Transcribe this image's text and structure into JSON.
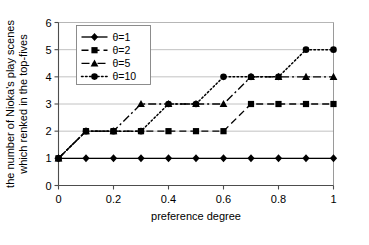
{
  "chart_data": {
    "type": "line",
    "title": "",
    "xlabel": "preference degree",
    "ylabel": "the number of Nioka's play scenes which renked in the top-fives",
    "xlim": [
      0,
      1
    ],
    "ylim": [
      0,
      6
    ],
    "grid": true,
    "legend_position": "top-left-inside",
    "x": [
      0,
      0.1,
      0.2,
      0.3,
      0.4,
      0.5,
      0.6,
      0.7,
      0.8,
      0.9,
      1
    ],
    "xticks": [
      "0",
      "0.2",
      "0.4",
      "0.6",
      "0.8",
      "1"
    ],
    "xtick_values": [
      0,
      0.2,
      0.4,
      0.6,
      0.8,
      1
    ],
    "yticks": [
      "0",
      "1",
      "2",
      "3",
      "4",
      "5",
      "6"
    ],
    "ytick_values": [
      0,
      1,
      2,
      3,
      4,
      5,
      6
    ],
    "series": [
      {
        "name": "θ=1",
        "marker": "diamond",
        "dash": "solid",
        "color": "#000000",
        "values": [
          1,
          1,
          1,
          1,
          1,
          1,
          1,
          1,
          1,
          1,
          1
        ]
      },
      {
        "name": "θ=2",
        "marker": "square",
        "dash": "dashed",
        "color": "#000000",
        "values": [
          1,
          2,
          2,
          2,
          2,
          2,
          2,
          3,
          3,
          3,
          3
        ]
      },
      {
        "name": "θ=5",
        "marker": "triangle",
        "dash": "dashdot",
        "color": "#000000",
        "values": [
          1,
          2,
          2,
          3,
          3,
          3,
          3,
          4,
          4,
          4,
          4
        ]
      },
      {
        "name": "θ=10",
        "marker": "circle",
        "dash": "dotted",
        "color": "#000000",
        "values": [
          1,
          2,
          2,
          2,
          3,
          3,
          4,
          4,
          4,
          5,
          5
        ]
      }
    ]
  }
}
